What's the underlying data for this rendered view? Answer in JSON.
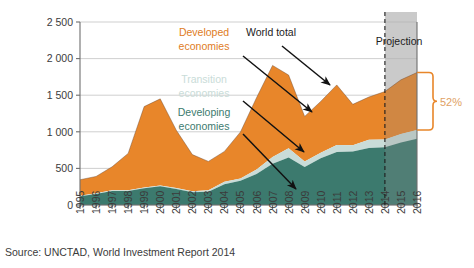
{
  "source": {
    "text": "Source: UNCTAD, World Investment Report 2014"
  },
  "annotations": {
    "developed_line1": "Developed",
    "developed_line2": "economies",
    "transition_line1": "Transition",
    "transition_line2": "economies",
    "developing_line1": "Developing",
    "developing_line2": "economies",
    "world_total": "World total",
    "projection": "Projection",
    "share_label": "52%"
  },
  "colors": {
    "developed": "#e8862a",
    "transition": "#c9dcd8",
    "developing": "#3c7a6e",
    "projection_overlay": "#9a9a9a",
    "gridline": "#c9c9c9",
    "axis": "#6e6e6e",
    "arrow": "#111111",
    "bracket": "#e8862a",
    "share_text": "#e0a164"
  },
  "chart_data": {
    "type": "area",
    "title": "",
    "subtitle": "",
    "xlabel": "",
    "ylabel": "",
    "stacked": true,
    "grid": true,
    "legend_position": "inline-annotations",
    "ylim": [
      0,
      2500
    ],
    "yticks": [
      "0",
      "500",
      "1 000",
      "1 500",
      "2 000",
      "2 500"
    ],
    "ytick_values": [
      0,
      500,
      1000,
      1500,
      2000,
      2500
    ],
    "categories": [
      "1995",
      "1996",
      "1997",
      "1998",
      "1999",
      "2000",
      "2001",
      "2002",
      "2003",
      "2004",
      "2005",
      "2006",
      "2007",
      "2008",
      "2009",
      "2010",
      "2011",
      "2012",
      "2013",
      "2014",
      "2015",
      "2016"
    ],
    "x": [
      1995,
      1996,
      1997,
      1998,
      1999,
      2000,
      2001,
      2002,
      2003,
      2004,
      2005,
      2006,
      2007,
      2008,
      2009,
      2010,
      2011,
      2012,
      2013,
      2014,
      2015,
      2016
    ],
    "projection_start": "2014",
    "projection_start_index": 19,
    "series": [
      {
        "name": "Developing economies",
        "color": "#3c7a6e",
        "values": [
          118,
          150,
          190,
          190,
          230,
          255,
          220,
          175,
          180,
          285,
          330,
          425,
          565,
          650,
          520,
          640,
          725,
          730,
          780,
          790,
          855,
          905
        ]
      },
      {
        "name": "Transition economies",
        "color": "#c9dcd8",
        "values": [
          8,
          10,
          12,
          10,
          10,
          10,
          12,
          14,
          20,
          32,
          33,
          60,
          92,
          125,
          75,
          75,
          95,
          85,
          110,
          105,
          115,
          120
        ]
      },
      {
        "name": "Developed economies",
        "color": "#e8862a",
        "values": [
          219,
          230,
          320,
          505,
          1105,
          1185,
          790,
          500,
          395,
          415,
          635,
          980,
          1250,
          1000,
          615,
          700,
          820,
          560,
          585,
          655,
          740,
          785
        ]
      }
    ],
    "world_total": [
      345,
      390,
      522,
      705,
      1345,
      1450,
      1022,
      689,
      595,
      732,
      998,
      1465,
      1907,
      1775,
      1210,
      1415,
      1640,
      1375,
      1475,
      1550,
      1710,
      1810
    ],
    "annotation_share": {
      "label": "52%",
      "description": "Developing and transition economies share of world total in 2016",
      "value": 52,
      "unit": "%"
    }
  }
}
